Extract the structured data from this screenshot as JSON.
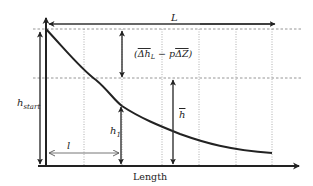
{
  "diagram": {
    "type": "schematic water-level profile along channel length",
    "labels": {
      "total_length": "L",
      "x_axis": "Length",
      "h_start_base": "h",
      "h_start_sub": "start",
      "h1_base": "h",
      "h1_sub": "1",
      "segment_length": "l",
      "h_mean": "h",
      "delta_open": "(",
      "delta_h": "Δh",
      "delta_h_sub": "L",
      "delta_minus": " − p",
      "delta_z": "ΔZ",
      "delta_close": ")"
    },
    "gridlines": {
      "horizontal_dashed_count": 2,
      "vertical_dotted_count": 6
    },
    "colors": {
      "line": "#222222",
      "grid": "#999999",
      "background": "#ffffff"
    }
  }
}
